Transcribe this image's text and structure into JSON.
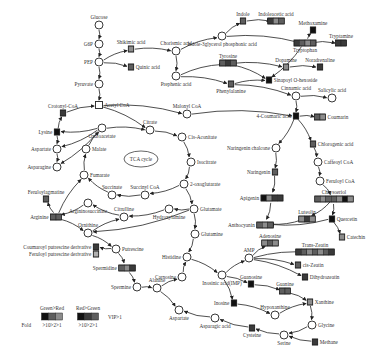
{
  "colors": {
    "k": "#111111",
    "d": "#3a3a3a",
    "m": "#5e5e5e",
    "l": "#8c8c8c",
    "x": "#b0b0b0"
  },
  "center_label": "TCA cycle",
  "nodes": [
    {
      "id": "glucose",
      "label": "Glucose",
      "type": "circle"
    },
    {
      "id": "g6p",
      "label": "G6P",
      "type": "circle"
    },
    {
      "id": "pep",
      "label": "PEP",
      "type": "circle"
    },
    {
      "id": "pyruvate",
      "label": "Pyruvate",
      "type": "circle"
    },
    {
      "id": "acetylcoa",
      "label": "Acetyl CoA",
      "type": "square"
    },
    {
      "id": "shikimic",
      "label": "Shikimic acid",
      "type": "box",
      "cells": "l"
    },
    {
      "id": "quinic",
      "label": "Quinic acid",
      "type": "box",
      "cells": "m"
    },
    {
      "id": "chorismic",
      "label": "Chorismic acid",
      "type": "circle"
    },
    {
      "id": "prephenic",
      "label": "Prephenic acid",
      "type": "circle"
    },
    {
      "id": "indole3gp",
      "label": "Indole-3glycerol phosphonic acid",
      "type": "circle"
    },
    {
      "id": "indole",
      "label": "Indole",
      "type": "box",
      "cells": "m"
    },
    {
      "id": "iaa",
      "label": "Indoleacetic acid",
      "type": "box",
      "cells": "dlm"
    },
    {
      "id": "methoxamine",
      "label": "Methoxamine",
      "type": "box",
      "cells": "k"
    },
    {
      "id": "tryptophan",
      "label": "Tryptophan",
      "type": "box",
      "cells": "dmlm"
    },
    {
      "id": "tryptamine",
      "label": "Tryptamine",
      "type": "box",
      "cells": "dd"
    },
    {
      "id": "tyrosine",
      "label": "Tyrosine",
      "type": "box",
      "cells": "mdm"
    },
    {
      "id": "dopamine",
      "label": "Dopamine",
      "type": "box",
      "cells": "l"
    },
    {
      "id": "noradrenaline",
      "label": "Noradrenaline",
      "type": "box",
      "cells": "d"
    },
    {
      "id": "phenylalanine",
      "label": "Phenylalanine",
      "type": "box",
      "cells": "m"
    },
    {
      "id": "sinapoyl",
      "label": "Sinapoyl O-hexoside",
      "type": "box",
      "cells": "k"
    },
    {
      "id": "cinnamic",
      "label": "Cinnamic acid",
      "type": "circle"
    },
    {
      "id": "salicylic",
      "label": "Salicylic acid",
      "type": "circle"
    },
    {
      "id": "coumaric",
      "label": "4-Coumaric acid",
      "type": "box",
      "cells": "k"
    },
    {
      "id": "coumarin",
      "label": "Coumarin",
      "type": "box",
      "cells": "ml"
    },
    {
      "id": "crotonylcoa",
      "label": "Crotonyl-CoA",
      "type": "box",
      "cells": "d"
    },
    {
      "id": "malonylcoa",
      "label": "Malonyl CoA",
      "type": "circle"
    },
    {
      "id": "lysine",
      "label": "Lysine",
      "type": "box",
      "cells": "k"
    },
    {
      "id": "aspartate_l",
      "label": "Aspartate",
      "type": "circle"
    },
    {
      "id": "asparagine",
      "label": "Asparagine",
      "type": "circle"
    },
    {
      "id": "oxaloacetate",
      "label": "Oxaloacetate",
      "type": "circle"
    },
    {
      "id": "malate",
      "label": "Malate",
      "type": "circle"
    },
    {
      "id": "citrate",
      "label": "Citrate",
      "type": "circle"
    },
    {
      "id": "cisaconitate",
      "label": "Cis-Aconitate",
      "type": "circle"
    },
    {
      "id": "isocitrate",
      "label": "Isocitrate",
      "type": "circle"
    },
    {
      "id": "oxoglutarate",
      "label": "2-oxoglutarate",
      "type": "circle"
    },
    {
      "id": "fumarate",
      "label": "Fumarate",
      "type": "circle"
    },
    {
      "id": "succinate",
      "label": "Succinate",
      "type": "circle"
    },
    {
      "id": "succinylcoa",
      "label": "Succinyl CoA",
      "type": "circle"
    },
    {
      "id": "glutamate",
      "label": "Glutamate",
      "type": "circle"
    },
    {
      "id": "glutamine",
      "label": "Glutamine",
      "type": "circle"
    },
    {
      "id": "hydroxylamine",
      "label": "Hydroxylamine",
      "type": "circle"
    },
    {
      "id": "citrulline",
      "label": "Citrulline",
      "type": "circle"
    },
    {
      "id": "argsucc",
      "label": "Argininosuccinate",
      "type": "circle"
    },
    {
      "id": "ornithine",
      "label": "Ornithine",
      "type": "circle"
    },
    {
      "id": "feruloylagmatine",
      "label": "Feruloylagmatine",
      "type": "box",
      "cells": "m"
    },
    {
      "id": "arginine",
      "label": "Arginine",
      "type": "box",
      "cells": "mm"
    },
    {
      "id": "coumaroylput",
      "label": "Coumaroyl putrescine derivative",
      "type": "box",
      "cells": "d"
    },
    {
      "id": "feruloylput",
      "label": "Feruloyl putrescine derivative",
      "type": "box",
      "cells": "x"
    },
    {
      "id": "putrescine",
      "label": "Putrescine",
      "type": "circle"
    },
    {
      "id": "spermidine",
      "label": "Spermidine",
      "type": "box",
      "cells": "mld"
    },
    {
      "id": "spermine",
      "label": "Spermine",
      "type": "circle"
    },
    {
      "id": "alanine",
      "label": "Alanine",
      "type": "circle"
    },
    {
      "id": "carnosine",
      "label": "Carnosine",
      "type": "circle"
    },
    {
      "id": "histidine",
      "label": "Histidine",
      "type": "circle"
    },
    {
      "id": "aspartate_b",
      "label": "Aspartate",
      "type": "circle"
    },
    {
      "id": "aspartic",
      "label": "Asparagic acid",
      "type": "circle"
    },
    {
      "id": "naringenin_ch",
      "label": "Naringenin chalcone",
      "type": "circle"
    },
    {
      "id": "naringenin",
      "label": "Naringenin",
      "type": "box",
      "cells": "m"
    },
    {
      "id": "apigenin",
      "label": "Apigenin",
      "type": "box",
      "cells": "kldd"
    },
    {
      "id": "chlorogenic",
      "label": "Chlorogenic acid",
      "type": "box",
      "cells": "m"
    },
    {
      "id": "caffeoylcoa",
      "label": "Caffeoyl CoA",
      "type": "circle"
    },
    {
      "id": "feruloylcoa",
      "label": "Feruloyl CoA",
      "type": "circle"
    },
    {
      "id": "chrysoeriol",
      "label": "Chrysoeriol",
      "type": "box",
      "cells": "mlmmlkl"
    },
    {
      "id": "luteolin",
      "label": "Luteolin",
      "type": "box",
      "cells": "ldl"
    },
    {
      "id": "quercetin",
      "label": "Quercetin",
      "type": "box",
      "cells": "k"
    },
    {
      "id": "catechin",
      "label": "Catechin",
      "type": "box",
      "cells": "l"
    },
    {
      "id": "anthocyanin",
      "label": "Anthocyanin",
      "type": "box",
      "cells": "mlm"
    },
    {
      "id": "adenosine",
      "label": "Adenosine",
      "type": "box",
      "cells": "lml"
    },
    {
      "id": "amp",
      "label": "AMP",
      "type": "circle"
    },
    {
      "id": "transzeatin",
      "label": "Trans-Zeatin",
      "type": "box",
      "cells": "dmlmlmd"
    },
    {
      "id": "ciszeatin",
      "label": "cis-Zeatin",
      "type": "box",
      "cells": "m"
    },
    {
      "id": "dihydrozeatin",
      "label": "Dihydrozeatin",
      "type": "box",
      "cells": "d"
    },
    {
      "id": "imp",
      "label": "Inosinic acid(IMP)",
      "type": "circle"
    },
    {
      "id": "guanosine",
      "label": "Guanosine",
      "type": "box",
      "cells": "k"
    },
    {
      "id": "guanine",
      "label": "Guanine",
      "type": "box",
      "cells": "mm"
    },
    {
      "id": "inosine",
      "label": "Inosine",
      "type": "box",
      "cells": "k"
    },
    {
      "id": "hypoxanthine",
      "label": "Hypoxanthine",
      "type": "circle"
    },
    {
      "id": "xanthine",
      "label": "Xanthine",
      "type": "box",
      "cells": "l"
    },
    {
      "id": "glycine",
      "label": "Glycine",
      "type": "circle"
    },
    {
      "id": "serine",
      "label": "Serine",
      "type": "circle"
    },
    {
      "id": "cysteine",
      "label": "Cysteine",
      "type": "box",
      "cells": "d"
    },
    {
      "id": "methane",
      "label": "Methane",
      "type": "box",
      "cells": "d"
    }
  ],
  "legend": {
    "green_red": {
      "title": "Green>Red",
      "cells": "kml",
      "scale": ">10>2>1"
    },
    "red_green": {
      "title": "Red>Green",
      "cells": "kdm",
      "scale": ">10>2>1"
    },
    "fold_label": "Fold",
    "vip_label": "VIP>1"
  }
}
